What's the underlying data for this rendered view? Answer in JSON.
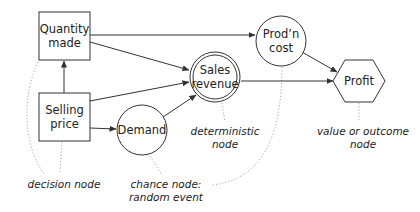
{
  "diagram": {
    "type": "influence-diagram",
    "nodes": {
      "quantity": {
        "line1": "Quantity",
        "line2": "made",
        "kind": "decision"
      },
      "price": {
        "line1": "Selling",
        "line2": "price",
        "kind": "decision"
      },
      "demand": {
        "line1": "Demand",
        "kind": "chance"
      },
      "sales": {
        "line1": "Sales",
        "line2": "revenue",
        "kind": "deterministic"
      },
      "cost": {
        "line1": "Prod’n",
        "line2": "cost",
        "kind": "deterministic"
      },
      "profit": {
        "line1": "Profit",
        "kind": "value"
      }
    },
    "edges": [
      [
        "Selling price",
        "Quantity made"
      ],
      [
        "Quantity made",
        "Prod'n cost"
      ],
      [
        "Quantity made",
        "Sales revenue"
      ],
      [
        "Selling price",
        "Sales revenue"
      ],
      [
        "Selling price",
        "Demand"
      ],
      [
        "Demand",
        "Sales revenue"
      ],
      [
        "Prod'n cost",
        "Profit"
      ],
      [
        "Sales revenue",
        "Profit"
      ]
    ],
    "annotations": {
      "decision": "decision node",
      "chance_1": "chance node:",
      "chance_2": "random event",
      "deterministic_1": "deterministic",
      "deterministic_2": "node",
      "value_1": "value or outcome",
      "value_2": "node"
    }
  }
}
